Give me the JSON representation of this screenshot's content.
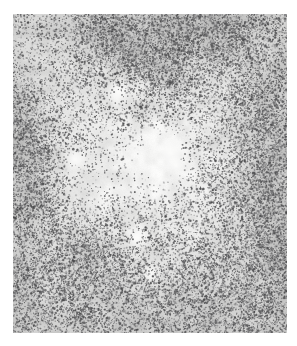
{
  "domain": "Natural-Image",
  "image": {
    "kind": "histopathology-micrograph",
    "description": "Light-microscopy photomicrograph of lymphoid tissue section with dark punctate cell nuclei on a pale mottled background",
    "canvas_width": 297,
    "canvas_height": 346,
    "margins": {
      "left": 13,
      "top": 14,
      "right": 10,
      "bottom": 13
    },
    "plate": {
      "x": 13,
      "y": 14,
      "width": 274,
      "height": 319
    },
    "page_background": "#ffffff"
  },
  "palette": {
    "page": "#ffffff",
    "field_light": "#f4f4f3",
    "field_mid": "#e9e9e7",
    "field_shadow": "#dcdcda",
    "nucleus_dark": "#3a3a3c",
    "nucleus_mid": "#6e6e70",
    "nucleus_faint": "#a8a8a9",
    "stroma_tint": "#cfcfcd",
    "highlight": "#fbfbfa"
  },
  "render": {
    "seed": 20240617,
    "grain_cell_px": 2,
    "grain_amplitude": 16,
    "base_tone": 241,
    "vignette_strength": 0.1,
    "nuclei_total": 24000,
    "nucleus_min_radius": 0.55,
    "nucleus_max_radius": 1.75,
    "cluster_count": 520,
    "cluster_spread": 11,
    "cluster_members_min": 4,
    "cluster_members_max": 16
  },
  "density_field": {
    "comment": "Normalized regions describing local nuclear density across the plate (0 = pale/sparse, 1 = dark/dense).",
    "baseline": 0.46,
    "blobs": [
      {
        "name": "upper-center-dense-band",
        "cx": 0.46,
        "cy": 0.1,
        "rx": 0.3,
        "ry": 0.14,
        "amp": 0.62
      },
      {
        "name": "upper-right-dense",
        "cx": 0.72,
        "cy": 0.07,
        "rx": 0.3,
        "ry": 0.12,
        "amp": 0.4
      },
      {
        "name": "upper-left-sparse",
        "cx": 0.12,
        "cy": 0.16,
        "rx": 0.22,
        "ry": 0.18,
        "amp": -0.22
      },
      {
        "name": "left-edge-dense-upper",
        "cx": 0.02,
        "cy": 0.33,
        "rx": 0.16,
        "ry": 0.13,
        "amp": 0.42
      },
      {
        "name": "left-edge-dense-mid",
        "cx": 0.03,
        "cy": 0.52,
        "rx": 0.15,
        "ry": 0.16,
        "amp": 0.36
      },
      {
        "name": "left-edge-dense-lower",
        "cx": 0.05,
        "cy": 0.86,
        "rx": 0.2,
        "ry": 0.16,
        "amp": 0.4
      },
      {
        "name": "pale-central-follicle",
        "cx": 0.52,
        "cy": 0.46,
        "rx": 0.26,
        "ry": 0.21,
        "amp": -0.34
      },
      {
        "name": "pale-central-core",
        "cx": 0.56,
        "cy": 0.44,
        "rx": 0.1,
        "ry": 0.09,
        "amp": -0.26
      },
      {
        "name": "pale-upper-mid",
        "cx": 0.35,
        "cy": 0.27,
        "rx": 0.14,
        "ry": 0.11,
        "amp": -0.2
      },
      {
        "name": "right-edge-dense-mid",
        "cx": 0.97,
        "cy": 0.42,
        "rx": 0.2,
        "ry": 0.26,
        "amp": 0.46
      },
      {
        "name": "right-edge-dense-lower",
        "cx": 0.95,
        "cy": 0.74,
        "rx": 0.22,
        "ry": 0.22,
        "amp": 0.48
      },
      {
        "name": "lower-left-nodule",
        "cx": 0.28,
        "cy": 0.76,
        "rx": 0.13,
        "ry": 0.11,
        "amp": 0.34
      },
      {
        "name": "lower-left-nodule-halo",
        "cx": 0.28,
        "cy": 0.76,
        "rx": 0.21,
        "ry": 0.18,
        "amp": 0.12
      },
      {
        "name": "lower-center-moderate",
        "cx": 0.52,
        "cy": 0.88,
        "rx": 0.26,
        "ry": 0.14,
        "amp": 0.2
      },
      {
        "name": "mid-left-pale",
        "cx": 0.3,
        "cy": 0.56,
        "rx": 0.16,
        "ry": 0.14,
        "amp": -0.22
      },
      {
        "name": "bottom-right-dense",
        "cx": 0.78,
        "cy": 0.95,
        "rx": 0.26,
        "ry": 0.13,
        "amp": 0.3
      },
      {
        "name": "bottom-edge-pale",
        "cx": 0.45,
        "cy": 1.0,
        "rx": 0.2,
        "ry": 0.06,
        "amp": -0.18
      }
    ],
    "pale_patches": [
      {
        "name": "central-clear-space",
        "cx": 0.575,
        "cy": 0.435,
        "r": 0.03,
        "tone": 252
      },
      {
        "name": "central-clear-space-2",
        "cx": 0.595,
        "cy": 0.475,
        "r": 0.018,
        "tone": 250
      },
      {
        "name": "upper-mid-clear",
        "cx": 0.385,
        "cy": 0.245,
        "r": 0.026,
        "tone": 249
      },
      {
        "name": "mid-left-clear",
        "cx": 0.225,
        "cy": 0.455,
        "r": 0.022,
        "tone": 248
      },
      {
        "name": "lower-center-clear",
        "cx": 0.505,
        "cy": 0.815,
        "r": 0.02,
        "tone": 249
      },
      {
        "name": "lower-mid-clear",
        "cx": 0.455,
        "cy": 0.7,
        "r": 0.024,
        "tone": 250
      }
    ],
    "stroma_strands": [
      {
        "name": "upper-diagonal-band",
        "x1": 0.3,
        "y1": 0.02,
        "x2": 0.58,
        "y2": 0.22,
        "width": 0.055,
        "amp": 0.34
      },
      {
        "name": "upper-right-band",
        "x1": 0.58,
        "y1": 0.05,
        "x2": 0.88,
        "y2": 0.02,
        "width": 0.045,
        "amp": 0.24
      },
      {
        "name": "left-vertical-band",
        "x1": 0.03,
        "y1": 0.28,
        "x2": 0.09,
        "y2": 0.6,
        "width": 0.05,
        "amp": 0.26
      },
      {
        "name": "center-sweep",
        "x1": 0.38,
        "y1": 0.33,
        "x2": 0.66,
        "y2": 0.29,
        "width": 0.035,
        "amp": 0.18
      },
      {
        "name": "right-vertical-band",
        "x1": 0.9,
        "y1": 0.25,
        "x2": 0.97,
        "y2": 0.7,
        "width": 0.05,
        "amp": 0.28
      },
      {
        "name": "lower-left-arc",
        "x1": 0.18,
        "y1": 0.7,
        "x2": 0.36,
        "y2": 0.82,
        "width": 0.045,
        "amp": 0.22
      },
      {
        "name": "bottom-band",
        "x1": 0.24,
        "y1": 0.96,
        "x2": 0.72,
        "y2": 0.99,
        "width": 0.04,
        "amp": 0.2
      },
      {
        "name": "mid-right-strand",
        "x1": 0.7,
        "y1": 0.52,
        "x2": 0.88,
        "y2": 0.62,
        "width": 0.03,
        "amp": 0.16
      }
    ]
  }
}
